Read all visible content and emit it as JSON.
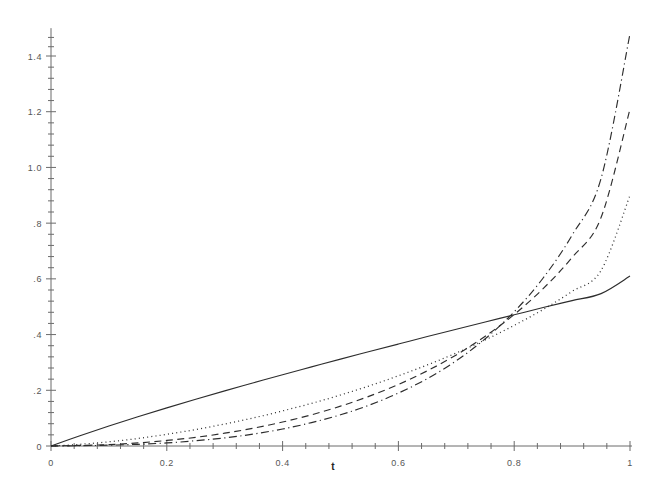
{
  "chart_data": {
    "type": "line",
    "title": "",
    "subtitle": "",
    "xlabel": "t",
    "ylabel": "",
    "xlim": [
      0,
      1
    ],
    "ylim": [
      0,
      1.5
    ],
    "grid": false,
    "legend": "none",
    "x_ticks_major": [
      "0",
      "0.2",
      "0.4",
      "0.6",
      "0.8",
      "1"
    ],
    "x_tick_values": [
      0,
      0.2,
      0.4,
      0.6,
      0.8,
      1
    ],
    "x_minor_tick_count": 4,
    "y_ticks_major": [
      "0",
      ".2",
      ".4",
      ".6",
      ".8",
      "1.0",
      "1.2",
      "1.4"
    ],
    "y_tick_values": [
      0,
      0.2,
      0.4,
      0.6,
      0.8,
      1.0,
      1.2,
      1.4
    ],
    "y_minor_tick_count": 4,
    "y_axis_top_value": 1.5,
    "x": [
      0,
      0.05,
      0.1,
      0.15,
      0.2,
      0.25,
      0.3,
      0.35,
      0.4,
      0.45,
      0.5,
      0.55,
      0.6,
      0.65,
      0.7,
      0.75,
      0.8,
      0.85,
      0.9,
      0.95,
      1
    ],
    "series": [
      {
        "name": "curve-1",
        "style": "solid",
        "color": "#2d2d2d",
        "values": [
          0,
          0.037,
          0.072,
          0.105,
          0.137,
          0.168,
          0.198,
          0.227,
          0.256,
          0.284,
          0.312,
          0.339,
          0.366,
          0.393,
          0.419,
          0.445,
          0.471,
          0.497,
          0.522,
          0.547,
          0.61
        ]
      },
      {
        "name": "curve-2",
        "style": "dotted",
        "color": "#2d2d2d",
        "values": [
          0,
          0.006,
          0.015,
          0.027,
          0.042,
          0.059,
          0.079,
          0.101,
          0.126,
          0.153,
          0.183,
          0.216,
          0.252,
          0.291,
          0.334,
          0.381,
          0.433,
          0.49,
          0.555,
          0.63,
          0.9
        ]
      },
      {
        "name": "curve-3",
        "style": "dashed",
        "color": "#2d2d2d",
        "values": [
          0,
          0.002,
          0.005,
          0.011,
          0.02,
          0.031,
          0.046,
          0.064,
          0.086,
          0.112,
          0.143,
          0.179,
          0.221,
          0.27,
          0.327,
          0.394,
          0.472,
          0.565,
          0.677,
          0.82,
          1.21
        ]
      },
      {
        "name": "curve-4",
        "style": "dash-dot",
        "color": "#2d2d2d",
        "values": [
          0,
          0.001,
          0.003,
          0.006,
          0.011,
          0.019,
          0.029,
          0.043,
          0.061,
          0.084,
          0.112,
          0.147,
          0.19,
          0.242,
          0.306,
          0.385,
          0.482,
          0.603,
          0.757,
          0.96,
          1.48
        ]
      }
    ]
  },
  "axis": {
    "x_title": "t",
    "origin_label": "0"
  }
}
